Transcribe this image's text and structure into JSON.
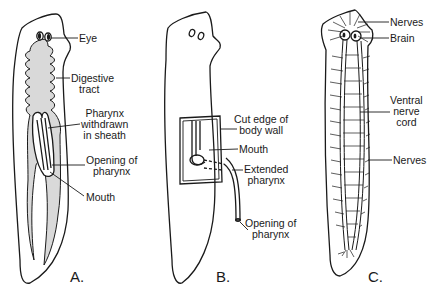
{
  "figure": {
    "panels": [
      {
        "id": "A",
        "letter": "A.",
        "labels": {
          "eye": "Eye",
          "digestive_l1": "Digestive",
          "digestive_l2": "tract",
          "pharynx_l1": "Pharynx",
          "pharynx_l2": "withdrawn",
          "pharynx_l3": "in sheath",
          "opening_l1": "Opening of",
          "opening_l2": "pharynx",
          "mouth": "Mouth"
        }
      },
      {
        "id": "B",
        "letter": "B.",
        "labels": {
          "cut_l1": "Cut edge of",
          "cut_l2": "body wall",
          "mouth": "Mouth",
          "extended_l1": "Extended",
          "extended_l2": "pharynx",
          "opening_l1": "Opening of",
          "opening_l2": "pharynx"
        }
      },
      {
        "id": "C",
        "letter": "C.",
        "labels": {
          "nerves_top": "Nerves",
          "brain": "Brain",
          "ventral_l1": "Ventral",
          "ventral_l2": "nerve",
          "ventral_l3": "cord",
          "nerves_bottom": "Nerves"
        }
      }
    ],
    "colors": {
      "ink": "#1a1a1a",
      "gut_fill": "#d9d9d9",
      "background": "#ffffff"
    }
  }
}
